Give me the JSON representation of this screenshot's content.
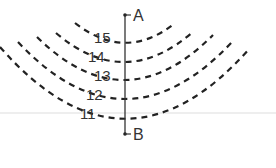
{
  "diagram": {
    "type": "contour-map",
    "point_top": "A",
    "point_bottom": "B",
    "contours": [
      {
        "label": "15",
        "value": 15
      },
      {
        "label": "14",
        "value": 14
      },
      {
        "label": "13",
        "value": 13
      },
      {
        "label": "12",
        "value": 12
      },
      {
        "label": "11",
        "value": 11
      }
    ]
  },
  "colors": {
    "line": "#222222",
    "label": "#333333",
    "background": "#ffffff",
    "faint_rule": "#e6e6e6"
  }
}
